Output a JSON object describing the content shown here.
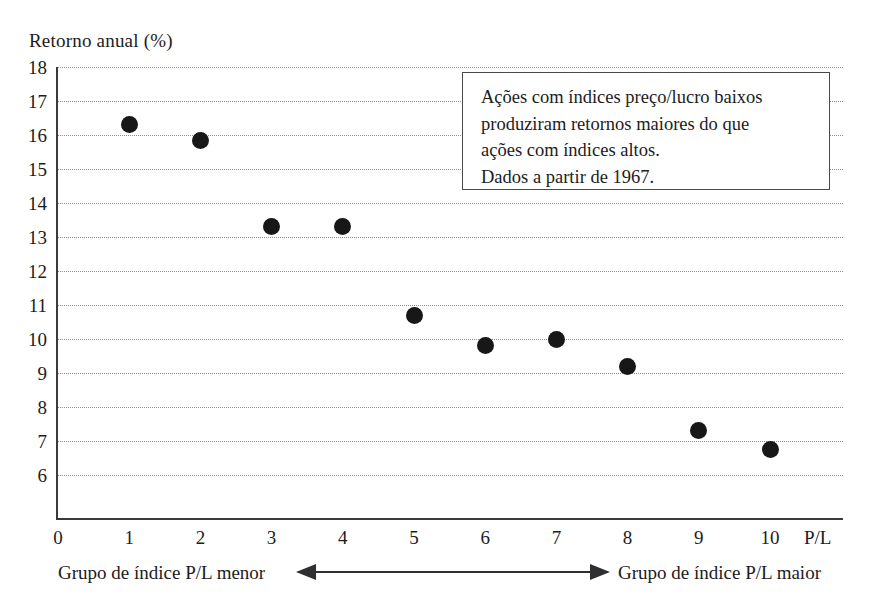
{
  "chart_data": {
    "type": "scatter",
    "title": "Retorno anual (%)",
    "xlabel": "P/L",
    "ylabel": "Retorno anual (%)",
    "x": [
      1,
      2,
      3,
      4,
      5,
      6,
      7,
      8,
      9,
      10
    ],
    "values": [
      16.3,
      15.85,
      13.3,
      13.3,
      10.7,
      9.8,
      10.0,
      9.2,
      7.3,
      6.75
    ],
    "categories": [
      "1",
      "2",
      "3",
      "4",
      "5",
      "6",
      "7",
      "8",
      "9",
      "10"
    ],
    "series": [
      {
        "name": "Retorno anual por grupo de índice P/L",
        "values": [
          16.3,
          15.85,
          13.3,
          13.3,
          10.7,
          9.8,
          10.0,
          9.2,
          7.3,
          6.75
        ]
      }
    ],
    "xlim": [
      0,
      11
    ],
    "ylim": [
      5.3,
      18
    ],
    "xticks": [
      "0",
      "1",
      "2",
      "3",
      "4",
      "5",
      "6",
      "7",
      "8",
      "9",
      "10"
    ],
    "yticks": [
      "18",
      "17",
      "16",
      "15",
      "14",
      "13",
      "12",
      "11",
      "10",
      "9",
      "8",
      "7",
      "6"
    ],
    "grid": "horizontal-dotted",
    "legend": "none",
    "marker_color": "#171717",
    "annotations": [
      "Ações com índices preço/lucro baixos",
      "produziram retornos maiores do que",
      "ações com índices altos.",
      "Dados a partir de 1967."
    ]
  },
  "axis": {
    "y_label": "Retorno anual (%)",
    "x_unit_label": "P/L",
    "y_ticks": [
      {
        "label": "18",
        "value": 18
      },
      {
        "label": "17",
        "value": 17
      },
      {
        "label": "16",
        "value": 16
      },
      {
        "label": "15",
        "value": 15
      },
      {
        "label": "14",
        "value": 14
      },
      {
        "label": "13",
        "value": 13
      },
      {
        "label": "12",
        "value": 12
      },
      {
        "label": "11",
        "value": 11
      },
      {
        "label": "10",
        "value": 10
      },
      {
        "label": "9",
        "value": 9
      },
      {
        "label": "8",
        "value": 8
      },
      {
        "label": "7",
        "value": 7
      },
      {
        "label": "6",
        "value": 6
      }
    ],
    "x_ticks": [
      {
        "label": "0",
        "value": 0
      },
      {
        "label": "1",
        "value": 1
      },
      {
        "label": "2",
        "value": 2
      },
      {
        "label": "3",
        "value": 3
      },
      {
        "label": "4",
        "value": 4
      },
      {
        "label": "5",
        "value": 5
      },
      {
        "label": "6",
        "value": 6
      },
      {
        "label": "7",
        "value": 7
      },
      {
        "label": "8",
        "value": 8
      },
      {
        "label": "9",
        "value": 9
      },
      {
        "label": "10",
        "value": 10
      }
    ]
  },
  "annotation": {
    "lines": [
      "Ações com índices preço/lucro baixos",
      "produziram retornos maiores do que",
      "ações com índices altos.",
      "Dados a partir de 1967."
    ]
  },
  "captions": {
    "left": "Grupo de índice P/L menor",
    "right": "Grupo de índice P/L maior"
  },
  "colors": {
    "marker": "#171717",
    "axis": "#3a3a3c",
    "grid": "#8d8d92",
    "text": "#1c1c1c",
    "box_border": "#4a4a4c",
    "background": "#ffffff"
  }
}
